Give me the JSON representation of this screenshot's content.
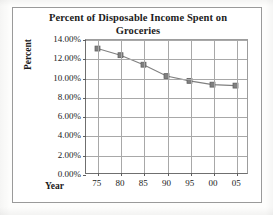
{
  "chart_data": {
    "type": "line",
    "title": "Percent of Disposable Income Spent on Groceries",
    "title_line1": "Percent of Disposable Income Spent on",
    "title_line2": "Groceries",
    "xlabel": "Year",
    "ylabel": "Percent",
    "categories": [
      "75",
      "80",
      "85",
      "90",
      "95",
      "00",
      "05"
    ],
    "values": [
      13.1,
      12.4,
      11.4,
      10.2,
      9.7,
      9.3,
      9.2
    ],
    "value_labels": [
      "13.10%",
      "12.40%",
      "11.40%",
      "10.20%",
      "9.70%",
      "9.30%",
      "9.20%"
    ],
    "ylim": [
      0,
      14
    ],
    "ytick_values": [
      14,
      12,
      10,
      8,
      6,
      4,
      2,
      0
    ],
    "ytick_labels": [
      "14.00%",
      "12.00%",
      "10.00%",
      "8.00%",
      "6.00%",
      "4.00%",
      "2.00%",
      "0.00%"
    ],
    "grid": true,
    "legend": false,
    "marker": "square",
    "series_color": "#808080",
    "grid_color": "#a8a8a8",
    "axis_color": "#5d5d5d",
    "text_color": "#1a1a1a",
    "background": "#ffffff"
  }
}
